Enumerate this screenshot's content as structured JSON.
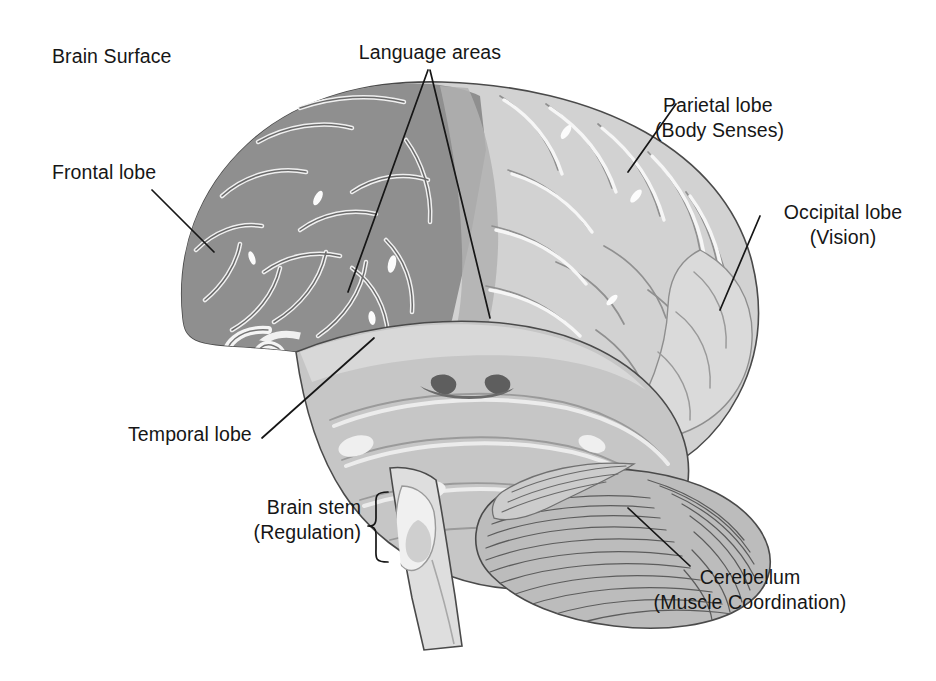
{
  "figure": {
    "title": "Brain Surface",
    "type": "anatomical-diagram",
    "background_color": "#ffffff",
    "ink_color": "#161616"
  },
  "labels": {
    "brain_surface": "Brain Surface",
    "language_areas": "Language areas",
    "frontal_lobe": "Frontal lobe",
    "parietal_lobe_line1": "Parietal lobe",
    "parietal_lobe_line2": "(Body Senses)",
    "occipital_lobe_line1": "Occipital lobe",
    "occipital_lobe_line2": "(Vision)",
    "temporal_lobe": "Temporal lobe",
    "brain_stem_line1": "Brain stem",
    "brain_stem_line2": "(Regulation)",
    "cerebellum_line1": "Cerebellum",
    "cerebellum_line2": "(Muscle Coordination)"
  },
  "regions": {
    "frontal_cortex_color": "#8f8f8f",
    "parietal_occipital_color": "#d2d2d2",
    "temporal_color": "#c4c4c4",
    "cerebellum_color": "#b8b8b8",
    "brainstem_color": "#dcdcdc",
    "sulci_line_color": "#6e6e6e",
    "gyri_highlight_color": "#f2f2f2",
    "outline_color": "#3a3a3a"
  }
}
